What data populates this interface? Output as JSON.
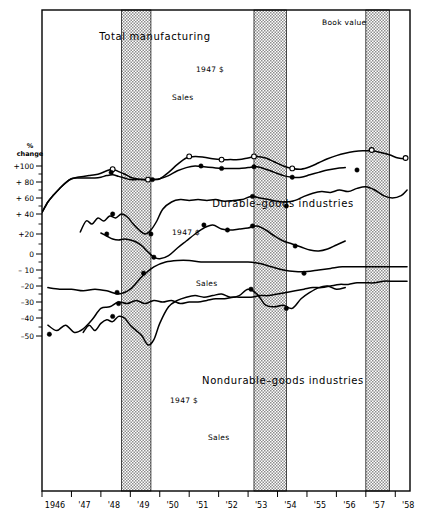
{
  "figure": {
    "yaxis_caption_line1": "%",
    "yaxis_caption_line2": "change",
    "ylabels": [
      "+100",
      "+ 80",
      "+ 60",
      "+ 40",
      "+20",
      "0",
      "– 10",
      "–20",
      "–30",
      "–40",
      "–50"
    ],
    "xlabels": [
      "1946",
      "'47",
      "'48",
      "'49",
      "'50",
      "'51",
      "'52",
      "'53",
      "'54",
      "'55",
      "'56",
      "'57",
      "'58"
    ],
    "sections": [
      {
        "title": "Total manufacturing"
      },
      {
        "title": "Durable–goods industries"
      },
      {
        "title": "Nondurable–goods industries"
      }
    ],
    "series_labels": {
      "book_value": "Book value",
      "constant_dollars": "1947 $",
      "sales": "Sales"
    }
  },
  "chart_data": {
    "type": "line",
    "title": "",
    "xlabel": "",
    "ylabel": "% change",
    "grid": false,
    "legend": "inline-annotations",
    "xlim": [
      1946.0,
      1958.5
    ],
    "ylim": [
      -55,
      115
    ],
    "x_tick_labels": [
      "1946",
      "'47",
      "'48",
      "'49",
      "'50",
      "'51",
      "'52",
      "'53",
      "'54",
      "'55",
      "'56",
      "'57",
      "'58"
    ],
    "x_tick_values": [
      1946,
      1947,
      1948,
      1949,
      1950,
      1951,
      1952,
      1953,
      1954,
      1955,
      1956,
      1957,
      1958
    ],
    "y_tick_labels": [
      "+100",
      "+ 80",
      "+ 60",
      "+ 40",
      "+20",
      "0",
      "– 10",
      "–20",
      "–30",
      "–40",
      "–50"
    ],
    "y_tick_values": [
      100,
      80,
      60,
      40,
      20,
      0,
      -10,
      -20,
      -30,
      -40,
      -50
    ],
    "shaded_bands": [
      {
        "name": "recession-1948-49",
        "x_start": 1948.7,
        "x_end": 1949.7
      },
      {
        "name": "recession-1953-54",
        "x_start": 1953.2,
        "x_end": 1954.3
      },
      {
        "name": "recession-1957-58",
        "x_start": 1957.0,
        "x_end": 1957.8
      }
    ],
    "panels": [
      {
        "name": "total-manufacturing",
        "title": "Total manufacturing",
        "series": [
          {
            "name": "Book value",
            "marker": "open-circle",
            "x": [
              1946.0,
              1946.2,
              1946.4,
              1946.6,
              1946.8,
              1947.0,
              1947.2,
              1947.4,
              1947.6,
              1947.8,
              1948.0,
              1948.2,
              1948.4,
              1948.6,
              1948.8,
              1949.0,
              1949.2,
              1949.4,
              1949.6,
              1949.8,
              1950.0,
              1950.3,
              1950.6,
              1950.9,
              1951.2,
              1951.5,
              1951.8,
              1952.1,
              1952.4,
              1952.7,
              1953.0,
              1953.3,
              1953.6,
              1953.9,
              1954.2,
              1954.5,
              1954.8,
              1955.1,
              1955.4,
              1955.7,
              1956.0,
              1956.3,
              1956.6,
              1956.9,
              1957.2,
              1957.5,
              1957.8,
              1958.1,
              1958.4
            ],
            "y": [
              42,
              55,
              64,
              72,
              79,
              84,
              86,
              87,
              88,
              89,
              91,
              94,
              96,
              93,
              90,
              86,
              84,
              83,
              83,
              83,
              84,
              92,
              102,
              110,
              112,
              111,
              109,
              108,
              108,
              108,
              110,
              112,
              110,
              105,
              100,
              97,
              96,
              99,
              104,
              109,
              113,
              116,
              118,
              119,
              119,
              117,
              114,
              110,
              109
            ]
          },
          {
            "name": "1947 $",
            "marker": "filled-circle",
            "x": [
              1946.0,
              1946.2,
              1946.4,
              1946.6,
              1946.8,
              1947.0,
              1947.2,
              1947.4,
              1947.6,
              1947.8,
              1948.0,
              1948.2,
              1948.4,
              1948.6,
              1948.8,
              1949.0,
              1949.2,
              1949.4,
              1949.6,
              1949.8,
              1950.0,
              1950.3,
              1950.6,
              1950.9,
              1951.2,
              1951.5,
              1951.8,
              1952.1,
              1952.4,
              1952.7,
              1953.0,
              1953.3,
              1953.6,
              1953.9,
              1954.2,
              1954.5,
              1954.8,
              1955.1,
              1955.4,
              1955.7,
              1956.0,
              1956.3
            ],
            "y": [
              42,
              55,
              64,
              72,
              79,
              84,
              85,
              85,
              85,
              85,
              86,
              88,
              89,
              87,
              85,
              83,
              83,
              83,
              83,
              83,
              84,
              88,
              94,
              98,
              100,
              99,
              98,
              97,
              97,
              97,
              98,
              99,
              96,
              92,
              88,
              86,
              86,
              89,
              92,
              95,
              97,
              98
            ]
          },
          {
            "name": "Sales",
            "marker": "filled-circle",
            "x": [
              1947.3,
              1947.5,
              1947.7,
              1947.9,
              1948.1,
              1948.3,
              1948.5,
              1948.7,
              1948.9,
              1949.1,
              1949.3,
              1949.5,
              1949.7,
              1949.9,
              1950.1,
              1950.4,
              1950.7,
              1951.0,
              1951.3,
              1951.6,
              1951.9,
              1952.2,
              1952.5,
              1952.8,
              1953.1,
              1953.4,
              1953.7,
              1954.0,
              1954.3,
              1954.6,
              1954.9,
              1955.2,
              1955.5,
              1955.8,
              1956.1,
              1956.4,
              1956.7,
              1957.0,
              1957.3,
              1957.6,
              1957.9,
              1958.2,
              1958.4
            ],
            "y": [
              22,
              33,
              30,
              36,
              33,
              38,
              36,
              40,
              37,
              30,
              24,
              20,
              24,
              33,
              46,
              55,
              58,
              57,
              58,
              57,
              58,
              56,
              57,
              58,
              62,
              60,
              58,
              56,
              55,
              57,
              62,
              66,
              68,
              67,
              70,
              68,
              72,
              74,
              70,
              63,
              60,
              63,
              70
            ]
          }
        ],
        "annotation_points": [
          {
            "series": "Book value",
            "x": 1948.4,
            "y": 96,
            "marker": "open-circle"
          },
          {
            "series": "1947 $",
            "x": 1948.35,
            "y": 92,
            "marker": "filled-circle"
          },
          {
            "series": "Book value",
            "x": 1949.6,
            "y": 83,
            "marker": "open-circle"
          },
          {
            "series": "1947 $",
            "x": 1949.75,
            "y": 83,
            "marker": "filled-circle"
          },
          {
            "series": "Book value",
            "x": 1951.0,
            "y": 112,
            "marker": "open-circle"
          },
          {
            "series": "Book value",
            "x": 1952.1,
            "y": 108,
            "marker": "open-circle"
          },
          {
            "series": "Book value",
            "x": 1953.2,
            "y": 112,
            "marker": "open-circle"
          },
          {
            "series": "Book value",
            "x": 1954.5,
            "y": 97,
            "marker": "open-circle"
          },
          {
            "series": "Book value",
            "x": 1957.2,
            "y": 120,
            "marker": "open-circle"
          },
          {
            "series": "Book value",
            "x": 1958.35,
            "y": 110,
            "marker": "open-circle"
          },
          {
            "series": "1947 $",
            "x": 1951.4,
            "y": 100,
            "marker": "filled-circle"
          },
          {
            "series": "1947 $",
            "x": 1952.1,
            "y": 97,
            "marker": "filled-circle"
          },
          {
            "series": "1947 $",
            "x": 1953.2,
            "y": 99,
            "marker": "filled-circle"
          },
          {
            "series": "1947 $",
            "x": 1954.5,
            "y": 86,
            "marker": "filled-circle"
          },
          {
            "series": "1947 $",
            "x": 1956.7,
            "y": 95,
            "marker": "filled-circle"
          },
          {
            "series": "Sales",
            "x": 1948.4,
            "y": 40,
            "marker": "filled-circle"
          },
          {
            "series": "Sales",
            "x": 1949.7,
            "y": 20,
            "marker": "filled-circle"
          },
          {
            "series": "Sales",
            "x": 1953.15,
            "y": 62,
            "marker": "filled-circle"
          },
          {
            "series": "Sales",
            "x": 1954.3,
            "y": 50,
            "marker": "filled-circle"
          }
        ]
      },
      {
        "name": "durable-goods-industries",
        "title": "Durable–goods industries",
        "series": [
          {
            "name": "1947 $",
            "marker": "filled-circle",
            "x": [
              1948.0,
              1948.2,
              1948.4,
              1948.6,
              1948.8,
              1949.0,
              1949.2,
              1949.4,
              1949.6,
              1949.8,
              1950.0,
              1950.3,
              1950.6,
              1950.9,
              1951.2,
              1951.5,
              1951.8,
              1952.1,
              1952.4,
              1952.7,
              1953.0,
              1953.3,
              1953.6,
              1953.9,
              1954.2,
              1954.5,
              1954.8,
              1955.1,
              1955.4,
              1955.7,
              1956.0,
              1956.3
            ],
            "y": [
              21,
              18,
              15,
              14,
              15,
              14,
              12,
              8,
              2,
              -2,
              -3,
              -1,
              6,
              13,
              20,
              26,
              29,
              25,
              24,
              25,
              26,
              28,
              24,
              18,
              13,
              10,
              7,
              4,
              3,
              5,
              9,
              13
            ]
          },
          {
            "name": "Sales",
            "marker": "filled-circle",
            "x": [
              1947.4,
              1947.6,
              1947.8,
              1948.0,
              1948.2,
              1948.4,
              1948.6,
              1948.8,
              1949.0,
              1949.2,
              1949.4,
              1949.6,
              1949.8,
              1950.0,
              1950.3,
              1950.6,
              1950.9,
              1951.2,
              1951.5,
              1951.8,
              1952.1,
              1952.4,
              1952.7,
              1953.0,
              1953.3,
              1953.6,
              1953.9,
              1954.2,
              1954.5,
              1954.8,
              1955.1,
              1955.4,
              1955.7,
              1956.0,
              1956.3
            ],
            "y": [
              -48,
              -44,
              -47,
              -43,
              -41,
              -42,
              -39,
              -40,
              -44,
              -47,
              -50,
              -55,
              -52,
              -43,
              -33,
              -29,
              -27,
              -26,
              -27,
              -26,
              -25,
              -27,
              -26,
              -22,
              -25,
              -32,
              -33,
              -32,
              -34,
              -28,
              -24,
              -21,
              -20,
              -22,
              -21
            ]
          }
        ],
        "annotation_points": [
          {
            "series": "1947 $",
            "x": 1948.2,
            "y": 20,
            "marker": "filled-circle"
          },
          {
            "series": "1947 $",
            "x": 1949.8,
            "y": -2,
            "marker": "filled-circle"
          },
          {
            "series": "1947 $",
            "x": 1951.5,
            "y": 29,
            "marker": "filled-circle"
          },
          {
            "series": "1947 $",
            "x": 1952.3,
            "y": 24,
            "marker": "filled-circle"
          },
          {
            "series": "1947 $",
            "x": 1953.15,
            "y": 28,
            "marker": "filled-circle"
          },
          {
            "series": "1947 $",
            "x": 1954.6,
            "y": 8,
            "marker": "filled-circle"
          },
          {
            "series": "Sales",
            "x": 1948.4,
            "y": -39,
            "marker": "filled-circle"
          },
          {
            "series": "Sales",
            "x": 1953.1,
            "y": -22,
            "marker": "filled-circle"
          },
          {
            "series": "Sales",
            "x": 1954.3,
            "y": -34,
            "marker": "filled-circle"
          }
        ]
      },
      {
        "name": "nondurable-goods-industries",
        "title": "Nondurable–goods industries",
        "series": [
          {
            "name": "1947 $",
            "marker": "filled-circle",
            "x": [
              1946.2,
              1946.6,
              1947.0,
              1947.4,
              1947.8,
              1948.2,
              1948.6,
              1949.0,
              1949.4,
              1949.8,
              1950.2,
              1950.6,
              1951.0,
              1951.4,
              1951.8,
              1952.2,
              1952.6,
              1953.0,
              1953.4,
              1953.8,
              1954.2,
              1954.6,
              1955.0,
              1955.4,
              1955.8,
              1956.2,
              1956.6,
              1957.0,
              1957.4,
              1957.8,
              1958.2,
              1958.4
            ],
            "y": [
              -21,
              -22,
              -22,
              -23,
              -22,
              -23,
              -25,
              -22,
              -14,
              -8,
              -5,
              -4,
              -4,
              -5,
              -5,
              -5,
              -5,
              -5,
              -6,
              -8,
              -10,
              -11,
              -11,
              -10,
              -9,
              -8,
              -8,
              -8,
              -8,
              -8,
              -8,
              -8
            ]
          },
          {
            "name": "Sales",
            "marker": "filled-circle",
            "x": [
              1946.2,
              1946.5,
              1946.8,
              1947.1,
              1947.4,
              1947.7,
              1948.0,
              1948.3,
              1948.6,
              1948.9,
              1949.2,
              1949.5,
              1949.8,
              1950.1,
              1950.4,
              1950.7,
              1951.0,
              1951.3,
              1951.6,
              1951.9,
              1952.2,
              1952.5,
              1952.8,
              1953.1,
              1953.4,
              1953.7,
              1954.0,
              1954.3,
              1954.6,
              1954.9,
              1955.2,
              1955.5,
              1955.8,
              1956.1,
              1956.4,
              1956.7,
              1957.0,
              1957.3,
              1957.6,
              1957.9,
              1958.2,
              1958.4
            ],
            "y": [
              -44,
              -47,
              -44,
              -48,
              -46,
              -41,
              -34,
              -33,
              -30,
              -31,
              -29,
              -31,
              -29,
              -30,
              -29,
              -31,
              -30,
              -30,
              -29,
              -28,
              -28,
              -27,
              -27,
              -27,
              -26,
              -26,
              -25,
              -24,
              -23,
              -22,
              -21,
              -21,
              -20,
              -19,
              -19,
              -18,
              -18,
              -18,
              -17,
              -17,
              -17,
              -17
            ]
          }
        ],
        "annotation_points": [
          {
            "series": "1947 $",
            "x": 1948.55,
            "y": -24,
            "marker": "filled-circle"
          },
          {
            "series": "1947 $",
            "x": 1949.45,
            "y": -12,
            "marker": "filled-circle"
          },
          {
            "series": "1947 $",
            "x": 1954.9,
            "y": -12,
            "marker": "filled-circle"
          },
          {
            "series": "Sales",
            "x": 1946.25,
            "y": -49,
            "marker": "filled-circle"
          },
          {
            "series": "Sales",
            "x": 1948.6,
            "y": -31,
            "marker": "filled-circle"
          }
        ]
      }
    ]
  }
}
